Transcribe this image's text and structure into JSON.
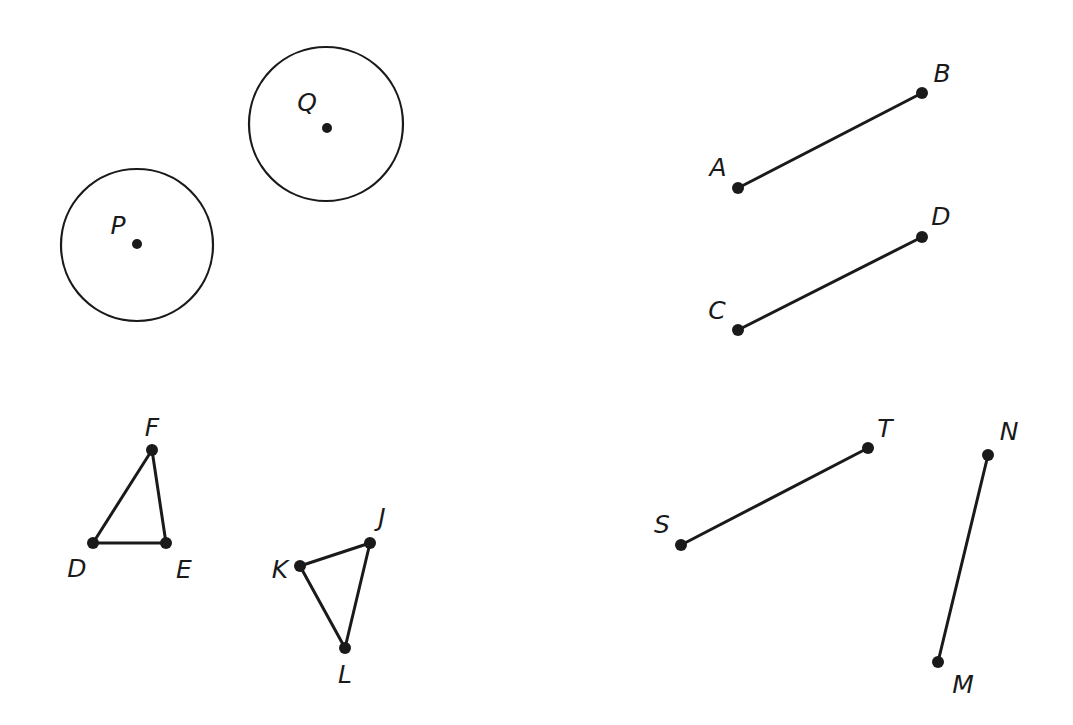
{
  "figure": {
    "background_color": "#ffffff",
    "stroke_color": "#1a1a1a",
    "width": 1073,
    "height": 725
  },
  "circles": [
    {
      "name": "circle-p",
      "label": "P",
      "center_x": 137,
      "center_y": 245,
      "radius": 76,
      "label_x": 118,
      "label_y": 227,
      "center_dot_x": 137,
      "center_dot_y": 244,
      "dot_radius": 5
    },
    {
      "name": "circle-q",
      "label": "Q",
      "center_x": 326,
      "center_y": 124,
      "radius": 77,
      "label_x": 307,
      "label_y": 104,
      "center_dot_x": 327,
      "center_dot_y": 128,
      "dot_radius": 5
    }
  ],
  "segments": [
    {
      "name": "segment-ab",
      "endpoints": [
        {
          "label": "A",
          "x": 738,
          "y": 188,
          "label_x": 718,
          "label_y": 169
        },
        {
          "label": "B",
          "x": 922,
          "y": 93,
          "label_x": 942,
          "label_y": 75
        }
      ],
      "dot_radius": 6
    },
    {
      "name": "segment-cd",
      "endpoints": [
        {
          "label": "C",
          "x": 738,
          "y": 330,
          "label_x": 717,
          "label_y": 312
        },
        {
          "label": "D",
          "x": 922,
          "y": 237,
          "label_x": 941,
          "label_y": 218
        }
      ],
      "dot_radius": 6
    },
    {
      "name": "segment-st",
      "endpoints": [
        {
          "label": "S",
          "x": 681,
          "y": 545,
          "label_x": 662,
          "label_y": 526
        },
        {
          "label": "T",
          "x": 868,
          "y": 448,
          "label_x": 885,
          "label_y": 430
        }
      ],
      "dot_radius": 6
    },
    {
      "name": "segment-mn",
      "endpoints": [
        {
          "label": "M",
          "x": 938,
          "y": 662,
          "label_x": 963,
          "label_y": 686
        },
        {
          "label": "N",
          "x": 988,
          "y": 455,
          "label_x": 1009,
          "label_y": 433
        }
      ],
      "dot_radius": 6
    }
  ],
  "triangles": [
    {
      "name": "triangle-def",
      "vertices": [
        {
          "label": "D",
          "x": 93,
          "y": 543,
          "label_x": 77,
          "label_y": 570
        },
        {
          "label": "E",
          "x": 166,
          "y": 543,
          "label_x": 184,
          "label_y": 571
        },
        {
          "label": "F",
          "x": 152,
          "y": 450,
          "label_x": 152,
          "label_y": 429
        }
      ],
      "dot_radius": 6
    },
    {
      "name": "triangle-jkl",
      "vertices": [
        {
          "label": "J",
          "x": 370,
          "y": 543,
          "label_x": 382,
          "label_y": 519
        },
        {
          "label": "K",
          "x": 300,
          "y": 566,
          "label_x": 280,
          "label_y": 571
        },
        {
          "label": "L",
          "x": 345,
          "y": 648,
          "label_x": 345,
          "label_y": 676
        }
      ],
      "dot_radius": 6
    }
  ]
}
